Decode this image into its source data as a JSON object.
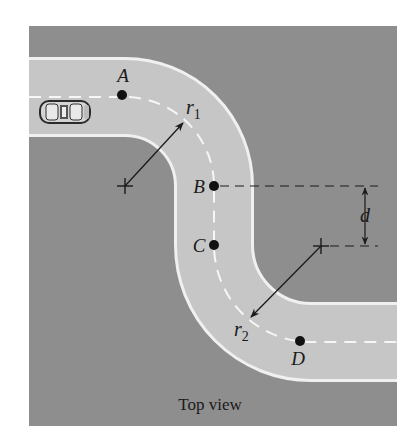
{
  "figure": {
    "caption": "Top view",
    "colors": {
      "ground": "#8e8e8e",
      "road": "#c6c6c6",
      "road_edge": "#f2f2f2",
      "center_line": "#f4f4f4",
      "ink": "#1a1a1a"
    },
    "points": [
      {
        "id": "A",
        "label": "A"
      },
      {
        "id": "B",
        "label": "B"
      },
      {
        "id": "C",
        "label": "C"
      },
      {
        "id": "D",
        "label": "D"
      }
    ],
    "radii": [
      {
        "id": "r1",
        "label": "r",
        "sub": "1"
      },
      {
        "id": "r2",
        "label": "r",
        "sub": "2"
      }
    ],
    "dimension": {
      "label": "d"
    },
    "vehicle": "sports-car"
  }
}
